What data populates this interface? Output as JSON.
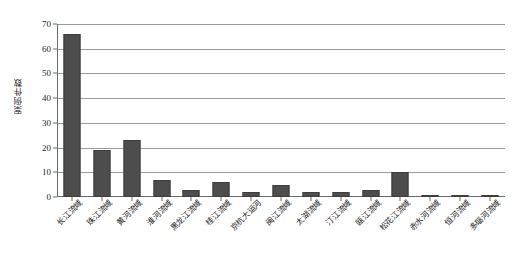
{
  "chart_data": {
    "type": "bar",
    "title": "",
    "xlabel": "",
    "ylabel": "案例件数",
    "ylim": [
      0,
      70
    ],
    "ytick_step": 10,
    "yticks": [
      70,
      60,
      50,
      40,
      30,
      20,
      10,
      0
    ],
    "grid": true,
    "legend": "none",
    "bar_color": "#4d4d4d",
    "categories": [
      "长江流域",
      "珠江流域",
      "黄河流域",
      "淮河流域",
      "黑龙江流域",
      "桂江流域",
      "京杭大运河",
      "闽江流域",
      "太湖流域",
      "汀江流域",
      "瓯江流域",
      "松花江流域",
      "赤水河流域",
      "恒河流域",
      "多瑙河流域"
    ],
    "values": [
      66,
      19,
      23,
      7,
      3,
      6,
      2,
      5,
      2,
      2,
      3,
      10,
      1,
      1,
      1
    ],
    "series": [
      {
        "name": "案例件数",
        "values": [
          66,
          19,
          23,
          7,
          3,
          6,
          2,
          5,
          2,
          2,
          3,
          10,
          1,
          1,
          1
        ]
      }
    ]
  }
}
